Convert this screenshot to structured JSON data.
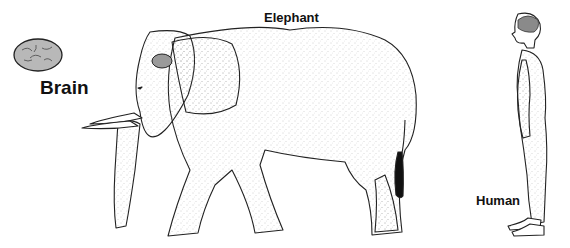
{
  "diagram": {
    "type": "illustration",
    "labels": {
      "brain": "Brain",
      "elephant": "Elephant",
      "human": "Human"
    },
    "figures": [
      {
        "id": "brain",
        "icon": "brain-icon",
        "label": "Brain"
      },
      {
        "id": "elephant",
        "icon": "elephant-figure",
        "label": "Elephant",
        "shows_brain": true
      },
      {
        "id": "human",
        "icon": "human-figure",
        "label": "Human",
        "shows_brain": true
      }
    ],
    "colors": {
      "outline": "#222222",
      "brain_fill": "#b8b8b8",
      "stipple": "#9a9a9a",
      "background": "#ffffff"
    }
  }
}
